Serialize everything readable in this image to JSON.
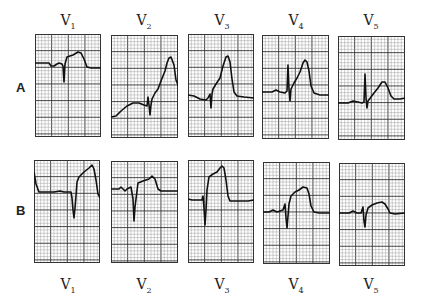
{
  "figure": {
    "rows": [
      {
        "label": "A",
        "label_pos": {
          "x": 16,
          "y": 80
        }
      },
      {
        "label": "B",
        "label_pos": {
          "x": 16,
          "y": 203
        }
      }
    ],
    "top_lead_labels": [
      {
        "base": "V",
        "sub": "1",
        "x": 68,
        "y": 12
      },
      {
        "base": "V",
        "sub": "2",
        "x": 144,
        "y": 12
      },
      {
        "base": "V",
        "sub": "3",
        "x": 222,
        "y": 12
      },
      {
        "base": "V",
        "sub": "4",
        "x": 296,
        "y": 12
      },
      {
        "base": "V",
        "sub": "5",
        "x": 371,
        "y": 12
      }
    ],
    "bottom_lead_labels": [
      {
        "base": "V",
        "sub": "1",
        "x": 68,
        "y": 276
      },
      {
        "base": "V",
        "sub": "2",
        "x": 144,
        "y": 276
      },
      {
        "base": "V",
        "sub": "3",
        "x": 222,
        "y": 276
      },
      {
        "base": "V",
        "sub": "4",
        "x": 296,
        "y": 276
      },
      {
        "base": "V",
        "sub": "5",
        "x": 371,
        "y": 276
      }
    ],
    "colors": {
      "grid_major": "#333333",
      "grid_minor": "#8a8a8a",
      "trace": "#111111",
      "paper": "#ffffff"
    },
    "panels": [
      {
        "row": "A",
        "lead": "V1",
        "x": 35,
        "y": 34,
        "w": 66,
        "h": 103,
        "trace": "0,29 14,29 16,32 19,32 22,30 24,29 27,30 28,32 29,48 30,30 32,23 38,21 43,18 46,19 49,25 52,33 56,34 66,34"
      },
      {
        "row": "A",
        "lead": "V2",
        "x": 111,
        "y": 35,
        "w": 67,
        "h": 103,
        "trace": "0,82 5,81 10,76 16,71 22,68 28,68 33,70 36,71 37,62 38,70 39,80 40,70 41,64 44,58 47,54 50,46 54,36 56,28 58,23 60,22 63,30 65,45 67,50 68,53 67,53"
      },
      {
        "row": "A",
        "lead": "V3",
        "x": 188,
        "y": 34,
        "w": 66,
        "h": 103,
        "trace": "0,61 6,62 12,65 18,66 20,64 22,60 23,74 24,60 25,55 28,50 32,44 35,32 38,23 40,22 42,28 44,45 46,58 49,62 56,63 66,64"
      },
      {
        "row": "A",
        "lead": "V4",
        "x": 262,
        "y": 35,
        "w": 67,
        "h": 104,
        "trace": "0,57 10,57 14,55 18,57 23,58 25,56 26,30 27,54 28,66 29,54 32,48 35,43 38,37 41,28 43,25 45,27 47,36 49,51 52,58 58,60 67,60"
      },
      {
        "row": "A",
        "lead": "V5",
        "x": 338,
        "y": 36,
        "w": 67,
        "h": 104,
        "trace": "0,67 10,67 15,65 20,66 24,67 26,66 27,38 28,62 29,72 30,65 33,61 36,57 40,52 44,46 47,46 50,52 53,60 56,63 62,63 67,62"
      },
      {
        "row": "B",
        "lead": "V1",
        "x": 34,
        "y": 160,
        "w": 66,
        "h": 103,
        "trace": "0,12 2,24 5,32 10,32 20,32 26,31 30,32 37,32 38,38 39,50 40,58 41,48 42,36 43,22 45,17 50,12 55,8 58,5 60,9 62,20 64,34 66,38"
      },
      {
        "row": "B",
        "lead": "V2",
        "x": 111,
        "y": 161,
        "w": 67,
        "h": 102,
        "trace": "0,28 8,28 10,26 12,28 14,30 16,28 20,26 22,38 23,60 24,46 26,30 27,22 32,20 38,18 41,15 44,18 47,28 50,30 60,30 67,30"
      },
      {
        "row": "B",
        "lead": "V3",
        "x": 188,
        "y": 160,
        "w": 66,
        "h": 103,
        "trace": "0,39 4,40 10,40 14,40 15,36 16,48 17,65 18,50 19,30 21,17 25,14 29,12 32,8 34,6 36,8 38,20 40,36 42,41 48,41 60,41 66,40"
      },
      {
        "row": "B",
        "lead": "V4",
        "x": 263,
        "y": 162,
        "w": 67,
        "h": 102,
        "trace": "0,50 6,50 10,48 14,50 20,48 22,42 23,56 24,66 25,54 26,42 28,34 32,30 36,28 40,25 44,26 46,32 48,44 51,50 56,51 67,51"
      },
      {
        "row": "B",
        "lead": "V5",
        "x": 339,
        "y": 163,
        "w": 66,
        "h": 103,
        "trace": "0,50 10,50 14,48 18,50 22,50 24,44 25,58 26,64 27,52 29,45 33,42 38,40 43,39 46,41 49,46 51,50 56,51 66,50"
      }
    ]
  }
}
